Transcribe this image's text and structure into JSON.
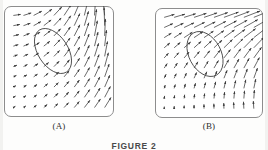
{
  "figure": {
    "caption": "FIGURE 2",
    "panels": [
      {
        "id": "A",
        "label": "(A)",
        "field_type": "vector-field",
        "description": "rotational vector field with elliptical region outline",
        "ellipse": {
          "cx": 49,
          "cy": 45,
          "rx": 15,
          "ry": 25,
          "rotation_deg": -33
        }
      },
      {
        "id": "B",
        "label": "(B)",
        "field_type": "vector-field",
        "description": "sheared vector field with elliptical region outline",
        "ellipse": {
          "cx": 50,
          "cy": 46,
          "rx": 16,
          "ry": 24,
          "rotation_deg": -28
        }
      }
    ]
  },
  "chart_data": {
    "type": "scatter",
    "title": "FIGURE 2",
    "xlabel": "",
    "ylabel": "",
    "grid": false,
    "legend": "none",
    "panels": [
      {
        "name": "(A)",
        "plot_type": "quiver",
        "xlim": [
          0,
          10
        ],
        "ylim": [
          0,
          10
        ],
        "grid_cols": 10,
        "grid_rows": 10,
        "annotation": "ellipse",
        "note": "Rotational flow: arrows near top point right and curve upward; arrows along right edge are long and near-vertical pointing up; arrows in lower-left are short pointing up; magnitude grows toward right and top."
      },
      {
        "name": "(B)",
        "plot_type": "quiver",
        "xlim": [
          0,
          10
        ],
        "ylim": [
          0,
          10
        ],
        "grid_cols": 10,
        "grid_rows": 10,
        "annotation": "ellipse",
        "note": "Shear flow: arrow direction rotates smoothly from horizontal-right at the top to vertical-up at the bottom; magnitude grows toward upper-right."
      }
    ]
  },
  "colors": {
    "ink": "#3a3a3a",
    "frame": "#8d8d8d",
    "paper": "#fdfdfc",
    "caption": "#4a4a4a"
  }
}
